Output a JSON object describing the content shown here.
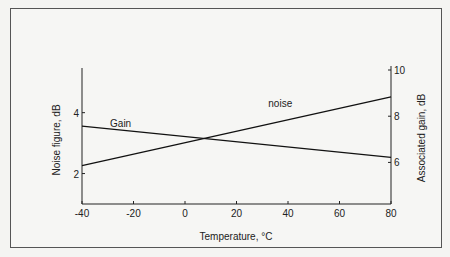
{
  "chart_data": {
    "type": "line",
    "title": "",
    "xlabel": "Temperature, °C",
    "ylabel": "Noise figure, dB",
    "y2label": "Associated gain, dB",
    "x_ticks": [
      -40,
      -20,
      0,
      20,
      40,
      60,
      80
    ],
    "y_ticks": [
      2,
      4
    ],
    "y2_ticks": [
      6,
      8,
      10
    ],
    "xlim": [
      -40,
      80
    ],
    "ylim": [
      1.0,
      5.5
    ],
    "y2lim": [
      4.2,
      10.0
    ],
    "grid": false,
    "legend": "inline labels",
    "series": [
      {
        "name": "noise",
        "axis": "left",
        "x": [
          -40,
          80
        ],
        "values": [
          2.26,
          4.52
        ],
        "label_at": {
          "x": 37,
          "y": 4.2
        }
      },
      {
        "name": "Gain",
        "axis": "right",
        "x": [
          -40,
          80
        ],
        "values": [
          7.57,
          6.22
        ],
        "label_at": {
          "x": -25,
          "y": 7.55
        }
      }
    ],
    "annotations": [
      {
        "text": "curves intersect near 8 °C"
      }
    ]
  }
}
